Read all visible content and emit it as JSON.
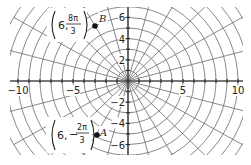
{
  "chart_data": {
    "type": "scatter",
    "coordinate_system": "polar grid on cartesian axes",
    "title": "",
    "xlabel": "",
    "ylabel": "",
    "xlim": [
      -10.5,
      10.5
    ],
    "ylim": [
      -6.8,
      7
    ],
    "x_ticks": [
      -10,
      -5,
      5,
      10
    ],
    "x_tick_labels": [
      "−10",
      "−5",
      "5",
      "10"
    ],
    "y_ticks": [
      6,
      4,
      2,
      -2,
      -4,
      -6
    ],
    "y_tick_labels": [
      "6",
      "4",
      "2",
      "−2",
      "−4",
      "−6"
    ],
    "grid": {
      "circle_radii": [
        1,
        2,
        3,
        4,
        5,
        6,
        7,
        8,
        9,
        10,
        11,
        12
      ],
      "ray_step_degrees": 15
    },
    "points": [
      {
        "name": "B",
        "r": 6,
        "theta_label": "8π/3",
        "theta_num": "8π",
        "theta_den": "3",
        "theta_sign": "",
        "theta_radians": 8.3776,
        "x": -3,
        "y": 5.196
      },
      {
        "name": "A",
        "r": 6,
        "theta_label": "−2π/3",
        "theta_num": "2π",
        "theta_den": "3",
        "theta_sign": "−",
        "theta_radians": -2.0944,
        "x": -3,
        "y": -5.196
      }
    ],
    "layout": {
      "origin_px": [
        128,
        81
      ],
      "unit_px_x": 11,
      "unit_px_y": 10.6,
      "clip_rect": [
        10,
        7,
        233,
        148
      ]
    }
  },
  "labels": {
    "B": {
      "r": "6,",
      "num": "8π",
      "den": "3",
      "sign": "",
      "name": "B"
    },
    "A": {
      "r": "6,",
      "num": "2π",
      "den": "3",
      "sign": "−",
      "name": "A"
    }
  }
}
